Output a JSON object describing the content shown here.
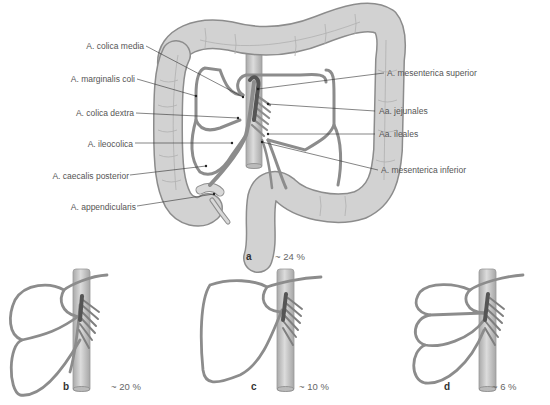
{
  "figure": {
    "panel_a": {
      "letter": "a",
      "percentage": "~ 24 %",
      "labels_left": [
        "A. colica media",
        "A. marginalis coli",
        "A. colica dextra",
        "A. ileocolica",
        "A. caecalis posterior",
        "A. appendicularis"
      ],
      "labels_right": [
        "A. mesenterica superior",
        "Aa. jejunales",
        "Aa. ileales",
        "A. mesenterica inferior"
      ]
    },
    "panel_b": {
      "letter": "b",
      "percentage": "~ 20 %"
    },
    "panel_c": {
      "letter": "c",
      "percentage": "~ 10 %"
    },
    "panel_d": {
      "letter": "d",
      "percentage": "~ 6 %"
    }
  },
  "colors": {
    "colon_fill": "#c8c8c8",
    "colon_stroke": "#8a8a8a",
    "artery": "#8c8c8c",
    "aorta": "#c4c4c4",
    "leader_line": "#333333",
    "label_text": "#555555"
  }
}
